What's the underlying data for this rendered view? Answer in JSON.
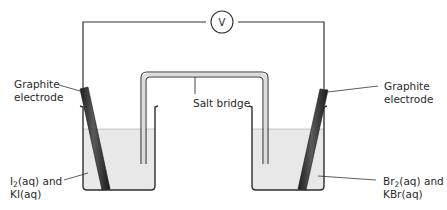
{
  "diagram": {
    "voltmeter": {
      "symbol": "V",
      "label": "voltmeter"
    },
    "salt_bridge": {
      "label": "Salt bridge"
    },
    "left": {
      "electrode_label_line1": "Graphite",
      "electrode_label_line2": "electrode",
      "solution_a_symbol": "I",
      "solution_a_sub": "2",
      "solution_a_rest": "(aq) and",
      "solution_b": "KI(aq)"
    },
    "right": {
      "electrode_label_line1": "Graphite",
      "electrode_label_line2": "electrode",
      "solution_a_symbol": "Br",
      "solution_a_sub": "2",
      "solution_a_rest": "(aq) and",
      "solution_b": "KBr(aq)"
    },
    "colors": {
      "wire": "#333333",
      "solution": "#e6e6e6",
      "electrode": "#3a3a3a",
      "glass": "#2e2e2e",
      "text": "#2a2a2a"
    }
  }
}
